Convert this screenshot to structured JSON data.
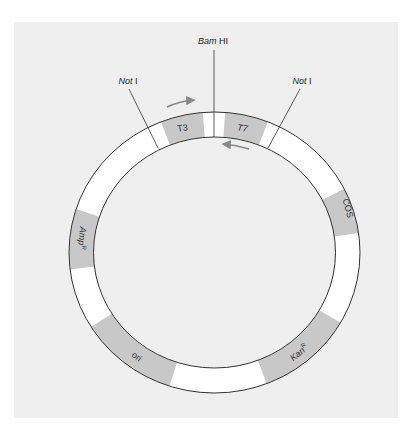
{
  "diagram": {
    "type": "plasmid-map",
    "colors": {
      "page_bg": "#ffffff",
      "panel_bg": "#efefef",
      "ring_fill": "#ffffff",
      "ring_stroke": "#333333",
      "segment_fill": "#c8c8c8",
      "arrow": "#8a8a8a"
    },
    "restriction_sites": [
      {
        "id": "bamhi",
        "italic": "Bam",
        "plain": " HI"
      },
      {
        "id": "noti-left",
        "italic": "Not",
        "plain": " I"
      },
      {
        "id": "noti-right",
        "italic": "Not",
        "plain": " I"
      }
    ],
    "segments": [
      {
        "id": "t3",
        "label": "T3"
      },
      {
        "id": "t7",
        "label": "T7"
      },
      {
        "id": "cos",
        "label": "COS"
      },
      {
        "id": "kanr",
        "label": "Kan",
        "superscript": "R"
      },
      {
        "id": "ori",
        "label": "ori"
      },
      {
        "id": "ampr",
        "label": "Amp",
        "superscript": "R"
      }
    ],
    "arrows": [
      {
        "id": "t3-promoter-arrow",
        "direction": "clockwise"
      },
      {
        "id": "t7-promoter-arrow",
        "direction": "counterclockwise"
      }
    ]
  }
}
